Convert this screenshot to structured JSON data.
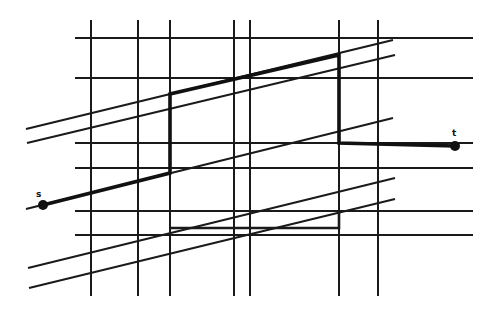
{
  "diagram": {
    "width": 497,
    "height": 316,
    "background": "#ffffff",
    "ink_color": "#1a1a1a",
    "vertical_lines": [
      {
        "x": 91,
        "y1": 20,
        "y2": 296
      },
      {
        "x": 138,
        "y1": 20,
        "y2": 296
      },
      {
        "x": 170,
        "y1": 20,
        "y2": 296
      },
      {
        "x": 234,
        "y1": 20,
        "y2": 296
      },
      {
        "x": 250,
        "y1": 20,
        "y2": 296
      },
      {
        "x": 339,
        "y1": 20,
        "y2": 296
      },
      {
        "x": 378,
        "y1": 20,
        "y2": 296
      }
    ],
    "horizontal_lines": [
      {
        "y": 38,
        "x1": 75,
        "x2": 473
      },
      {
        "y": 78,
        "x1": 75,
        "x2": 473
      },
      {
        "y": 143,
        "x1": 75,
        "x2": 473
      },
      {
        "y": 168,
        "x1": 75,
        "x2": 473
      },
      {
        "y": 211,
        "x1": 75,
        "x2": 473
      },
      {
        "y": 235,
        "x1": 75,
        "x2": 473
      }
    ],
    "diagonal_lines": [
      {
        "x1": 26,
        "y1": 129,
        "x2": 393,
        "y2": 40
      },
      {
        "x1": 27,
        "y1": 143,
        "x2": 395,
        "y2": 55
      },
      {
        "x1": 26,
        "y1": 209,
        "x2": 393,
        "y2": 118
      },
      {
        "x1": 28,
        "y1": 268,
        "x2": 395,
        "y2": 178
      },
      {
        "x1": 29,
        "y1": 288,
        "x2": 395,
        "y2": 199
      }
    ],
    "path": {
      "points": [
        [
          43,
          205
        ],
        [
          170,
          173
        ],
        [
          170,
          94
        ],
        [
          339,
          55
        ],
        [
          339,
          143
        ],
        [
          455,
          146
        ]
      ],
      "secondary_points": [
        [
          170,
          228
        ],
        [
          339,
          228
        ],
        [
          339,
          211
        ]
      ]
    },
    "endpoints": [
      {
        "id": "s",
        "label": "s",
        "x": 43,
        "y": 205,
        "label_x": 36,
        "label_y": 197
      },
      {
        "id": "t",
        "label": "t",
        "x": 455,
        "y": 146,
        "label_x": 452,
        "label_y": 136
      }
    ]
  }
}
